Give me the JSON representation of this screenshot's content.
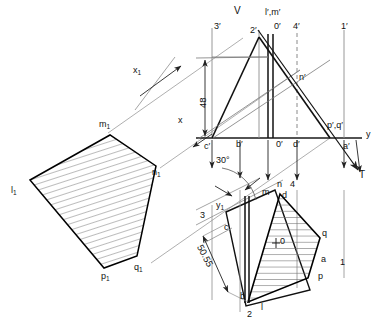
{
  "drawing": {
    "title": "Descriptive geometry projection of an oblique pentagon",
    "colors": {
      "outline": "#000000",
      "thin_line": "#7a7a7a",
      "hatch": "#6b6b6b",
      "dashed": "#8a8a8a",
      "text": "#111111",
      "background": "#ffffff"
    }
  },
  "planes": {
    "vertical_plane_label": "V",
    "ground_line_label": "x",
    "y_axis_label": "y",
    "aux_axis_1": "x",
    "aux_axis_1_sub": "1",
    "aux_axis_2": "y",
    "aux_axis_2_sub": "1",
    "trace_label": "T"
  },
  "dimensions": [
    {
      "name": "height-48",
      "value": "48"
    },
    {
      "name": "length-50-55",
      "value": "50.55"
    },
    {
      "name": "angle-30",
      "value": "30°"
    }
  ],
  "front_view_labels": [
    {
      "name": "point-3-prime",
      "text": "3′"
    },
    {
      "name": "point-2-prime",
      "text": "2′"
    },
    {
      "name": "point-l-m-prime",
      "text": "l′,m′"
    },
    {
      "name": "point-0-prime-top",
      "text": "0′"
    },
    {
      "name": "point-4-prime",
      "text": "4′"
    },
    {
      "name": "point-1-prime",
      "text": "1′"
    },
    {
      "name": "point-n-prime",
      "text": "n′"
    },
    {
      "name": "point-p-q-prime",
      "text": "p′,q′"
    },
    {
      "name": "point-c-prime",
      "text": "c′"
    },
    {
      "name": "point-b-prime",
      "text": "b′"
    },
    {
      "name": "point-0-prime-base",
      "text": "0′"
    },
    {
      "name": "point-d-prime",
      "text": "d′"
    },
    {
      "name": "point-a-prime",
      "text": "a′"
    }
  ],
  "top_view_labels": [
    {
      "name": "point-3",
      "text": "3"
    },
    {
      "name": "point-c",
      "text": "c"
    },
    {
      "name": "point-m",
      "text": "m"
    },
    {
      "name": "point-n",
      "text": "n"
    },
    {
      "name": "point-4",
      "text": "4"
    },
    {
      "name": "point-d",
      "text": "d"
    },
    {
      "name": "point-o",
      "text": "0"
    },
    {
      "name": "point-q",
      "text": "q"
    },
    {
      "name": "point-a",
      "text": "a"
    },
    {
      "name": "point-1",
      "text": "1"
    },
    {
      "name": "point-p",
      "text": "p"
    },
    {
      "name": "point-b",
      "text": "b"
    },
    {
      "name": "point-2",
      "text": "2"
    },
    {
      "name": "point-l",
      "text": "l"
    }
  ],
  "auxiliary_view_labels": [
    {
      "name": "point-m1",
      "text": "m",
      "sub": "1"
    },
    {
      "name": "point-n1",
      "text": "n",
      "sub": "1"
    },
    {
      "name": "point-l1",
      "text": "l",
      "sub": "1"
    },
    {
      "name": "point-q1",
      "text": "q",
      "sub": "1"
    },
    {
      "name": "point-p1",
      "text": "p",
      "sub": "1"
    }
  ]
}
